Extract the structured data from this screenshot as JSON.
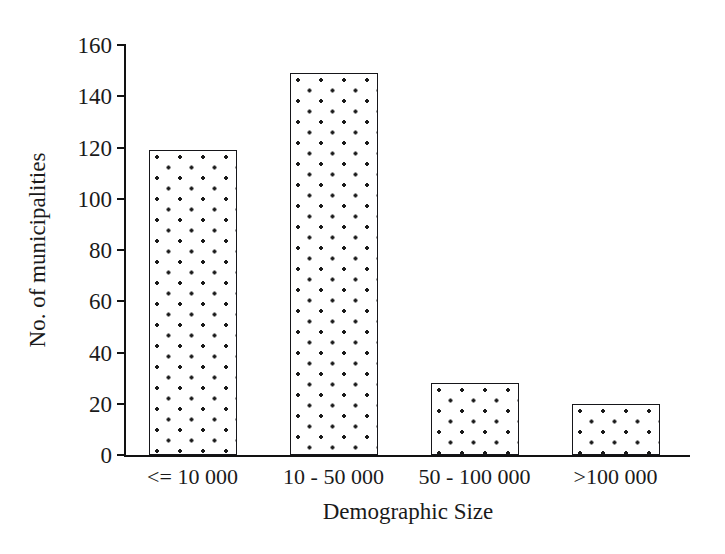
{
  "chart_data": {
    "type": "bar",
    "title": "",
    "subtitle": "",
    "xlabel": "Demographic Size",
    "ylabel": "No. of municipalities",
    "categories": [
      "<= 10 000",
      "10 - 50 000",
      "50 - 100 000",
      ">100 000"
    ],
    "values": [
      119,
      149,
      28,
      20
    ],
    "series": [
      {
        "name": "No. of municipalities",
        "values": [
          119,
          149,
          28,
          20
        ]
      }
    ],
    "ylim": [
      0,
      160
    ],
    "yticks": [
      0,
      20,
      40,
      60,
      80,
      100,
      120,
      140,
      160
    ],
    "ytick_labels": [
      "0",
      "20",
      "40",
      "60",
      "80",
      "100",
      "120",
      "140",
      "160"
    ],
    "grid": false,
    "legend": "none",
    "bar_fill": "dotted-pattern",
    "colors": {
      "bar_fill": "#ffffff",
      "bar_dots": "#1a1a1a",
      "bar_outline": "#16161a",
      "axis": "#121212",
      "text": "#1a1a1a",
      "background": "#ffffff"
    }
  }
}
